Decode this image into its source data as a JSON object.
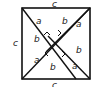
{
  "diagram": {
    "type": "pythagorean-proof-square",
    "outer_side_label": "c",
    "leg_labels": {
      "long": "b",
      "short": "a"
    },
    "labels": [
      {
        "text": "c",
        "x": 56,
        "y": 6
      },
      {
        "text": "c",
        "x": 14,
        "y": 45
      },
      {
        "text": "c",
        "x": 56,
        "y": 88
      },
      {
        "text": "a",
        "x": 37,
        "y": 23
      },
      {
        "text": "b",
        "x": 63,
        "y": 22
      },
      {
        "text": "a",
        "x": 79,
        "y": 26
      },
      {
        "text": "b",
        "x": 35,
        "y": 41
      },
      {
        "text": "b",
        "x": 78,
        "y": 52
      },
      {
        "text": "a",
        "x": 35,
        "y": 62
      },
      {
        "text": "b",
        "x": 51,
        "y": 69
      },
      {
        "text": "a",
        "x": 74,
        "y": 68
      }
    ],
    "colors": {
      "stroke": "#111111",
      "background": "#ffffff"
    }
  }
}
